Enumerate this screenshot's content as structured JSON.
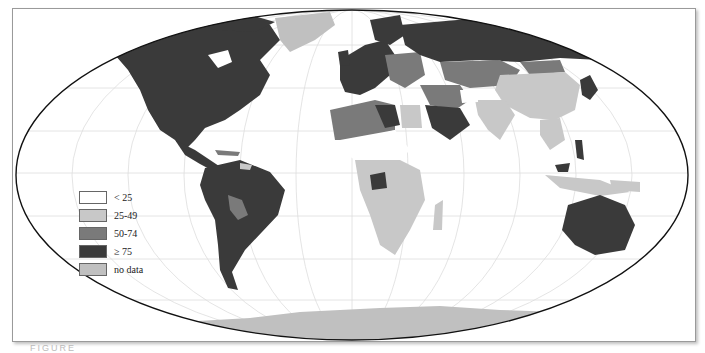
{
  "map": {
    "projection": "Robinson-like world map",
    "graticule": true,
    "colors": {
      "lt25": "#ffffff",
      "25_49": "#c8c8c8",
      "50_74": "#7a7a7a",
      "gte75": "#3a3a3a",
      "no_data": "#c0c0c0",
      "outline": "#111111",
      "graticule": "#dddddd"
    }
  },
  "legend": {
    "items": [
      {
        "label": "< 25",
        "color": "#ffffff"
      },
      {
        "label": "25-49",
        "color": "#c8c8c8"
      },
      {
        "label": "50-74",
        "color": "#7a7a7a"
      },
      {
        "label": "≥ 75",
        "color": "#3a3a3a"
      },
      {
        "label": "no data",
        "color": "#c0c0c0"
      }
    ]
  },
  "caption": "FIGURE"
}
